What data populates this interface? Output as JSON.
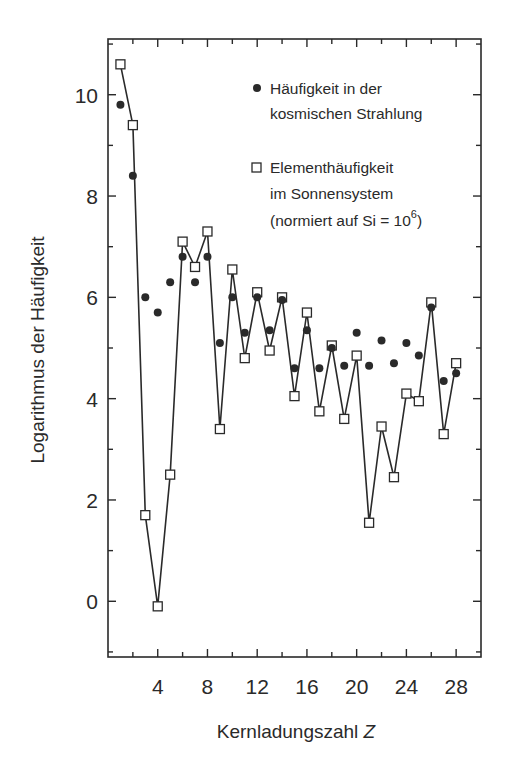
{
  "chart_data": {
    "type": "scatter",
    "title": "",
    "xlabel": "Kernladungszahl Z",
    "xlabel_main": "Kernladungszahl ",
    "xlabel_italic": "Z",
    "ylabel": "Logarithmus der Häufigkeit",
    "xlim": [
      0,
      30
    ],
    "ylim": [
      -1.1,
      11.1
    ],
    "x_ticks": [
      4,
      8,
      12,
      16,
      20,
      24,
      28
    ],
    "x_minor_ticks": [
      2,
      6,
      10,
      14,
      18,
      22,
      26
    ],
    "y_ticks": [
      0,
      2,
      4,
      6,
      8,
      10
    ],
    "y_minor_ticks": [
      -1,
      1,
      3,
      5,
      7,
      9,
      11
    ],
    "grid": false,
    "legend_position": "upper right",
    "x": [
      1,
      2,
      3,
      4,
      5,
      6,
      7,
      8,
      9,
      10,
      11,
      12,
      13,
      14,
      15,
      16,
      17,
      18,
      19,
      20,
      21,
      22,
      23,
      24,
      25,
      26,
      27,
      28
    ],
    "series": [
      {
        "name": "Häufigkeit in der kosmischen Strahlung",
        "marker": "filled-circle",
        "connected": false,
        "values": [
          9.8,
          8.4,
          6.0,
          5.7,
          6.3,
          6.8,
          6.3,
          6.8,
          5.1,
          6.0,
          5.3,
          6.0,
          5.35,
          5.95,
          4.6,
          5.35,
          4.6,
          5.0,
          4.65,
          5.3,
          4.65,
          5.15,
          4.7,
          5.1,
          4.85,
          5.8,
          4.35,
          4.5
        ]
      },
      {
        "name": "Elementhäufigkeit im Sonnensystem (normiert auf Si = 10^6)",
        "marker": "open-square",
        "connected": true,
        "values": [
          10.6,
          9.4,
          1.7,
          -0.1,
          2.5,
          7.1,
          6.6,
          7.3,
          3.4,
          6.55,
          4.8,
          6.1,
          4.95,
          6.0,
          4.05,
          5.7,
          3.75,
          5.05,
          3.6,
          4.85,
          1.55,
          3.45,
          2.45,
          4.1,
          3.95,
          5.9,
          3.3,
          4.7
        ]
      }
    ],
    "legend": [
      {
        "marker": "filled-circle",
        "lines": [
          "Häufigkeit in der",
          "kosmischen Strahlung"
        ]
      },
      {
        "marker": "open-square",
        "lines": [
          "Elementhäufigkeit",
          "im Sonnensystem"
        ],
        "last_line_prefix": "(normiert auf Si = 10",
        "last_line_sup": "6",
        "last_line_suffix": ")"
      }
    ],
    "colors": {
      "ink": "#2a2a2a",
      "background": "#ffffff"
    }
  }
}
